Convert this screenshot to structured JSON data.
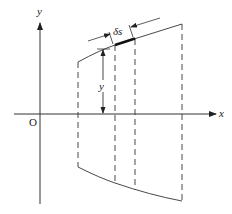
{
  "diagram": {
    "axes": {
      "x_label": "x",
      "y_label": "y",
      "origin_label": "O"
    },
    "annotations": {
      "height_label": "y",
      "arc_element_label": "δs"
    },
    "colors": {
      "line": "#333333",
      "background": "#ffffff"
    }
  }
}
